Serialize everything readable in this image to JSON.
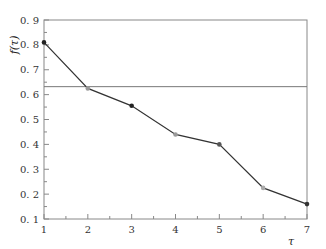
{
  "chart_data": {
    "type": "line",
    "title": "",
    "xlabel": "τ",
    "ylabel": "f(τ)",
    "x": [
      1,
      2,
      3,
      4,
      5,
      6,
      7
    ],
    "series": [
      {
        "name": "f(τ)",
        "values": [
          0.81,
          0.625,
          0.555,
          0.44,
          0.4,
          0.225,
          0.16
        ],
        "marker_colors": [
          "#222222",
          "#999999",
          "#222222",
          "#999999",
          "#555555",
          "#aaaaaa",
          "#333333"
        ]
      }
    ],
    "reference_line": {
      "y": 0.632,
      "orientation": "horizontal"
    },
    "xlim": [
      1,
      7
    ],
    "ylim": [
      0.1,
      0.9
    ],
    "xticks": [
      "1",
      "2",
      "3",
      "4",
      "5",
      "6",
      "7"
    ],
    "yticks": [
      "0.1",
      "0.2",
      "0.3",
      "0.4",
      "0.5",
      "0.6",
      "0.7",
      "0.8",
      "0.9"
    ],
    "grid": false,
    "legend": null,
    "colors": {
      "line": "#333333",
      "axis": "#888888",
      "reference": "#777777"
    }
  }
}
